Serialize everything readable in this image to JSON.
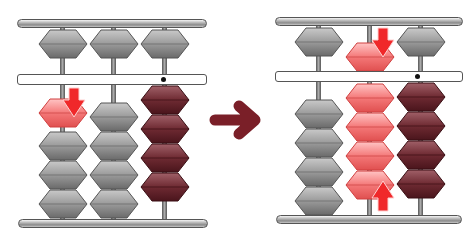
{
  "diagram": {
    "colors": {
      "gray_bead": "#8e8e8e",
      "red_bead": "#f06a6a",
      "maroon_bead": "#6e2a32",
      "arrow_red": "#f0282a",
      "transition_arrow": "#7a1f28",
      "frame": "#9a9a9a"
    },
    "before": {
      "label": "Before",
      "columns": [
        {
          "heaven_bead": "up",
          "earth_beads_up": 1,
          "earth_beads_down": 3,
          "highlight": "earth bead moving down (red)",
          "value_indicated": 0
        },
        {
          "heaven_bead": "up",
          "earth_beads_up": 0,
          "earth_beads_down": 4,
          "value_indicated": 0
        },
        {
          "heaven_bead": "up",
          "earth_beads_up": 4,
          "earth_beads_down": 0,
          "unit_dot": true,
          "value_indicated": 4
        }
      ]
    },
    "after": {
      "label": "After",
      "columns": [
        {
          "heaven_bead": "up",
          "earth_beads_up": 0,
          "earth_beads_down": 4,
          "value_indicated": 0
        },
        {
          "heaven_bead": "down",
          "earth_beads_up": 4,
          "earth_beads_down": 0,
          "highlight": "heaven bead down + 4 earth beads up (red)",
          "value_indicated": 9
        },
        {
          "heaven_bead": "up",
          "earth_beads_up": 4,
          "earth_beads_down": 0,
          "unit_dot": true,
          "value_indicated": 4
        }
      ]
    },
    "transition_arrow": "right-arrow"
  }
}
